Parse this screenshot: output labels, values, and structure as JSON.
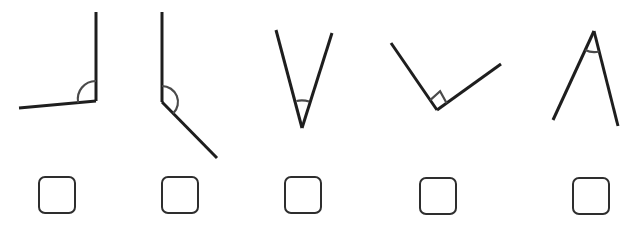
{
  "title": "Angle classification exercise",
  "colors": {
    "line": "#1e1e1e",
    "marker": "#4a4a4a",
    "checkbox_border": "#2e2e2e",
    "background": "#ffffff"
  },
  "angles": [
    {
      "id": 1,
      "type_hint": "obtuse",
      "marker": "arc",
      "checked": false
    },
    {
      "id": 2,
      "type_hint": "obtuse",
      "marker": "arc",
      "checked": false
    },
    {
      "id": 3,
      "type_hint": "acute",
      "marker": "arc",
      "checked": false
    },
    {
      "id": 4,
      "type_hint": "right",
      "marker": "square",
      "checked": false
    },
    {
      "id": 5,
      "type_hint": "acute",
      "marker": "arc",
      "checked": false
    }
  ]
}
